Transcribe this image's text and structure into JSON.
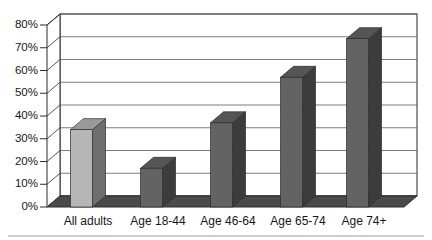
{
  "chart_data": {
    "type": "bar",
    "title": "",
    "subtitle": "",
    "xlabel": "",
    "ylabel": "",
    "categories": [
      "All adults",
      "Age 18-44",
      "Age 46-64",
      "Age 65-74",
      "Age 74+"
    ],
    "values": [
      34,
      17,
      37,
      57,
      74
    ],
    "value_labels": [
      "34%",
      "17%",
      "37%",
      "57%",
      "74%"
    ],
    "ylim": [
      0,
      80
    ],
    "ytick_values": [
      0,
      10,
      20,
      30,
      40,
      50,
      60,
      70,
      80
    ],
    "ytick_labels": [
      "0%",
      "10%",
      "20%",
      "30%",
      "40%",
      "50%",
      "60%",
      "70%",
      "80%"
    ],
    "grid": true,
    "grid_axis": "y",
    "legend": false,
    "legend_position": "none",
    "style": "3d-column",
    "series": [
      {
        "name": "Percent",
        "values": [
          34,
          17,
          37,
          57,
          74
        ]
      }
    ],
    "bar_colors": [
      "#b6b6b6",
      "#636363",
      "#636363",
      "#636363",
      "#636363"
    ],
    "bar_side_colors": [
      "#6e6e6e",
      "#3c3c3c",
      "#3c3c3c",
      "#3c3c3c",
      "#3c3c3c"
    ],
    "bar_top_colors": [
      "#9a9a9a",
      "#555555",
      "#555555",
      "#555555",
      "#555555"
    ],
    "colors": {
      "plot_background": "#ffffff",
      "floor": "#4a4a4a",
      "floor_edge": "#2e2e2e",
      "gridline": "#5a5a5a",
      "axis_line": "#2b2b2b",
      "text": "#161616",
      "page_background": "#ffffff",
      "footer_rule": "#9a9a9a"
    }
  },
  "yaxis": {
    "ticks": [
      {
        "label": "80%"
      },
      {
        "label": "70%"
      },
      {
        "label": "60%"
      },
      {
        "label": "50%"
      },
      {
        "label": "40%"
      },
      {
        "label": "30%"
      },
      {
        "label": "20%"
      },
      {
        "label": "10%"
      },
      {
        "label": "0%"
      }
    ]
  },
  "xaxis": {
    "ticks": [
      {
        "label": "All adults"
      },
      {
        "label": "Age 18-44"
      },
      {
        "label": "Age 46-64"
      },
      {
        "label": "Age 65-74"
      },
      {
        "label": "Age 74+"
      }
    ]
  }
}
